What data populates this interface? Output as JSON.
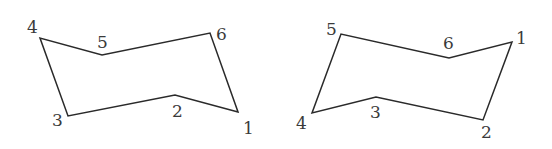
{
  "diagram": {
    "title": "",
    "shapes": [
      {
        "name": "chair-conformation-left",
        "vertices": [
          {
            "label": "1",
            "x": 238,
            "y": 112,
            "lx": 243,
            "ly": 134
          },
          {
            "label": "2",
            "x": 175,
            "y": 95,
            "lx": 172,
            "ly": 117
          },
          {
            "label": "3",
            "x": 68,
            "y": 116,
            "lx": 52,
            "ly": 126
          },
          {
            "label": "4",
            "x": 40,
            "y": 38,
            "lx": 27,
            "ly": 33
          },
          {
            "label": "5",
            "x": 102,
            "y": 55,
            "lx": 97,
            "ly": 48
          },
          {
            "label": "6",
            "x": 210,
            "y": 33,
            "lx": 216,
            "ly": 40
          }
        ]
      },
      {
        "name": "chair-conformation-right",
        "vertices": [
          {
            "label": "1",
            "x": 512,
            "y": 42,
            "lx": 516,
            "ly": 44
          },
          {
            "label": "2",
            "x": 483,
            "y": 120,
            "lx": 481,
            "ly": 138
          },
          {
            "label": "3",
            "x": 376,
            "y": 97,
            "lx": 370,
            "ly": 118
          },
          {
            "label": "4",
            "x": 312,
            "y": 113,
            "lx": 296,
            "ly": 129
          },
          {
            "label": "5",
            "x": 341,
            "y": 34,
            "lx": 326,
            "ly": 35
          },
          {
            "label": "6",
            "x": 449,
            "y": 58,
            "lx": 443,
            "ly": 49
          }
        ]
      }
    ]
  }
}
